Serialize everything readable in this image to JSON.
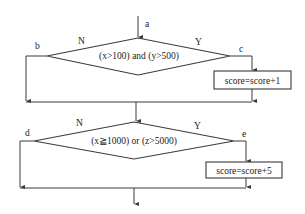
{
  "flowchart": {
    "entry_label": "a",
    "decision1": {
      "condition": "(x>100) and (y>500)",
      "no_label": "N",
      "yes_label": "Y",
      "left_point_label": "b",
      "right_point_label": "c",
      "yes_action": "score=score+1"
    },
    "decision2": {
      "condition": "(x≧1000) or (z>5000)",
      "no_label": "N",
      "yes_label": "Y",
      "left_point_label": "d",
      "right_point_label": "e",
      "yes_action": "score=score+5"
    }
  },
  "colors": {
    "line": "#3a3a3a",
    "text": "#222222",
    "background": "#ffffff"
  }
}
